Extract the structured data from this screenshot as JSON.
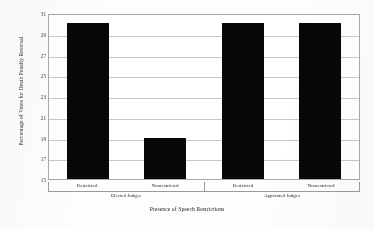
{
  "chart_data": {
    "type": "bar",
    "title": "",
    "xlabel": "Presence of Speech Restrictions",
    "ylabel": "Percentage of Votes for Death Penalty Reversal",
    "categories": [
      "Restricted",
      "Nonrestricted",
      "Restricted",
      "Nonrestricted"
    ],
    "values": [
      30,
      19,
      30,
      30
    ],
    "groups": [
      {
        "label": "Elected Judges",
        "categories": [
          "Restricted",
          "Nonrestricted"
        ],
        "values": [
          30,
          19
        ]
      },
      {
        "label": "Appointed Judges",
        "categories": [
          "Restricted",
          "Nonrestricted"
        ],
        "values": [
          30,
          30
        ]
      }
    ],
    "ylim": [
      15,
      31
    ],
    "ytick_step": 2,
    "yticks": [
      15,
      17,
      19,
      21,
      23,
      25,
      27,
      29,
      31
    ],
    "ytick_labels": [
      "15",
      "17",
      "19",
      "21",
      "23",
      "25",
      "27",
      "29",
      "31"
    ],
    "grid": true,
    "grid_axis": "y",
    "legend": false,
    "bar_color": "#080808",
    "gridline_color": "#c8c8c8",
    "axis_color": "#a9a9a9",
    "background_color": "#ffffff"
  }
}
